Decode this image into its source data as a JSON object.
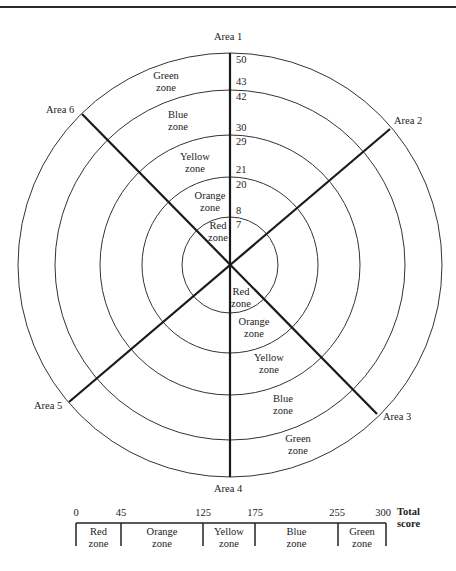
{
  "diagram": {
    "type": "radial-zone-wheel",
    "areas": [
      {
        "id": 1,
        "label": "Area 1"
      },
      {
        "id": 2,
        "label": "Area 2"
      },
      {
        "id": 3,
        "label": "Area 3"
      },
      {
        "id": 4,
        "label": "Area 4"
      },
      {
        "id": 5,
        "label": "Area 5"
      },
      {
        "id": 6,
        "label": "Area 6"
      }
    ],
    "zones": [
      {
        "name": "Red",
        "label_line1": "Red",
        "label_line2": "zone",
        "range": [
          0,
          7
        ]
      },
      {
        "name": "Orange",
        "label_line1": "Orange",
        "label_line2": "zone",
        "range": [
          8,
          20
        ]
      },
      {
        "name": "Yellow",
        "label_line1": "Yellow",
        "label_line2": "zone",
        "range": [
          21,
          29
        ]
      },
      {
        "name": "Blue",
        "label_line1": "Blue",
        "label_line2": "zone",
        "range": [
          30,
          42
        ]
      },
      {
        "name": "Green",
        "label_line1": "Green",
        "label_line2": "zone",
        "range": [
          43,
          50
        ]
      }
    ],
    "axis_numbers": [
      "50",
      "43",
      "42",
      "30",
      "29",
      "21",
      "20",
      "8",
      "7"
    ]
  },
  "total_score_bar": {
    "ticks": [
      "0",
      "45",
      "125",
      "175",
      "255",
      "300"
    ],
    "title_line1": "Total",
    "title_line2": "score",
    "segments": [
      {
        "line1": "Red",
        "line2": "zone",
        "from": 0,
        "to": 45
      },
      {
        "line1": "Orange",
        "line2": "zone",
        "from": 45,
        "to": 125
      },
      {
        "line1": "Yellow",
        "line2": "zone",
        "from": 125,
        "to": 175
      },
      {
        "line1": "Blue",
        "line2": "zone",
        "from": 175,
        "to": 255
      },
      {
        "line1": "Green",
        "line2": "zone",
        "from": 255,
        "to": 300
      }
    ]
  }
}
